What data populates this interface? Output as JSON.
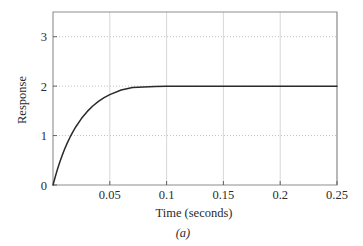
{
  "figure": {
    "caption": "(a)"
  },
  "chart_data": {
    "type": "line",
    "title": "",
    "xlabel": "Time (seconds)",
    "ylabel": "Response",
    "xlim": [
      0,
      0.25
    ],
    "ylim": [
      0,
      3.5
    ],
    "xticks": [
      0.05,
      0.1,
      0.15,
      0.2,
      0.25
    ],
    "xtick_labels": [
      "0.05",
      "0.1",
      "0.15",
      "0.2",
      "0.25"
    ],
    "yticks": [
      0,
      1,
      2,
      3
    ],
    "ytick_labels": [
      "0",
      "1",
      "2",
      "3"
    ],
    "grid": {
      "horizontal": "dotted",
      "vertical": "solid",
      "color": "#c4c4c4"
    },
    "legend": null,
    "series": [
      {
        "name": "step response",
        "color": "#2a2a2a",
        "description": "first-order exponential step response rising from 0 to steady-state 2",
        "steady_state": 2,
        "time_constant": 0.0228,
        "x": [
          0,
          0.002,
          0.004,
          0.006,
          0.008,
          0.01,
          0.0125,
          0.015,
          0.0175,
          0.02,
          0.025,
          0.03,
          0.035,
          0.04,
          0.045,
          0.05,
          0.06,
          0.07,
          0.08,
          0.09,
          0.1,
          0.11,
          0.12,
          0.13,
          0.14,
          0.15,
          0.175,
          0.2,
          0.225,
          0.25
        ],
        "y": [
          0,
          0.168,
          0.322,
          0.464,
          0.594,
          0.713,
          0.847,
          0.967,
          1.076,
          1.174,
          1.344,
          1.484,
          1.598,
          1.691,
          1.767,
          1.829,
          1.922,
          1.973,
          1.985,
          1.992,
          1.996,
          1.998,
          1.999,
          1.999,
          2.0,
          2.0,
          2.0,
          2.0,
          2.0,
          2.0
        ]
      }
    ]
  }
}
